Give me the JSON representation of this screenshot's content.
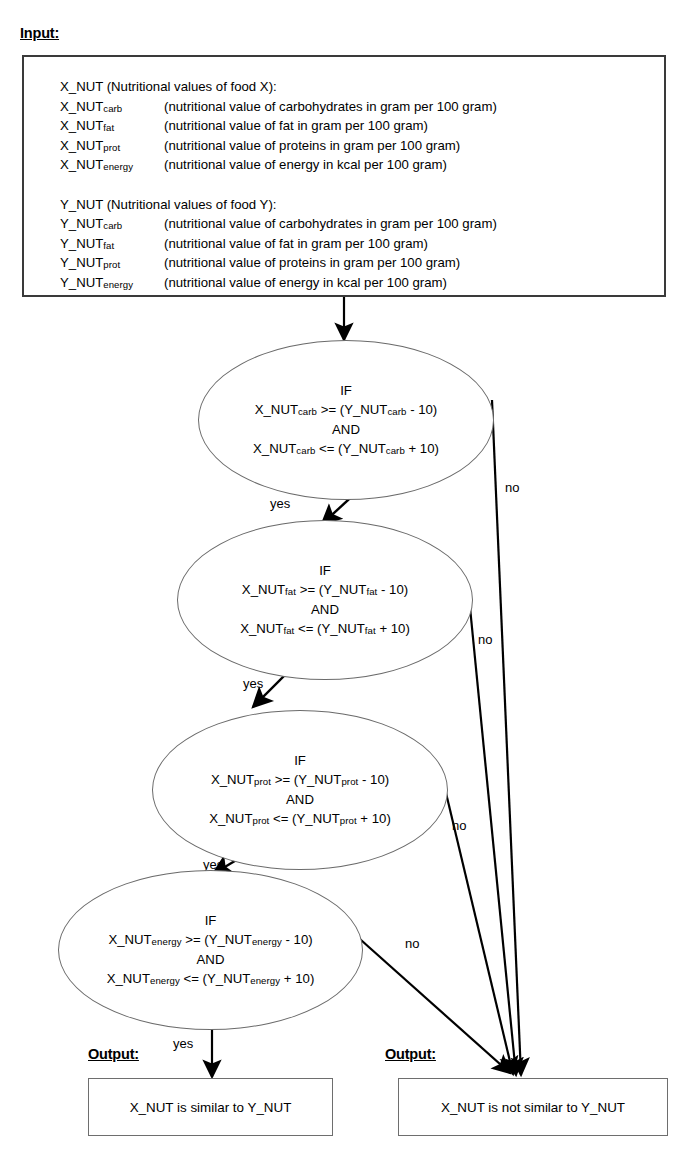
{
  "diagram": {
    "type": "flowchart",
    "title_labels": {
      "input": "Input:",
      "output_left": "Output:",
      "output_right": "Output:"
    }
  },
  "input": {
    "groups": [
      {
        "heading": "X_NUT (Nutritional values  of food X):",
        "rows": [
          {
            "name": "X_NUT",
            "sub": "carb",
            "desc": "(nutritional value of carbohydrates in gram per 100 gram)"
          },
          {
            "name": "X_NUT",
            "sub": "fat",
            "desc": "(nutritional value of fat in gram per 100 gram)"
          },
          {
            "name": "X_NUT",
            "sub": "prot",
            "desc": "(nutritional value of proteins in gram per 100 gram)"
          },
          {
            "name": "X_NUT",
            "sub": "energy",
            "desc": "(nutritional value of energy in kcal per 100 gram)"
          }
        ]
      },
      {
        "heading": "Y_NUT (Nutritional values  of food Y):",
        "rows": [
          {
            "name": "Y_NUT",
            "sub": "carb",
            "desc": "(nutritional value of carbohydrates in gram per 100 gram)"
          },
          {
            "name": "Y_NUT",
            "sub": "fat",
            "desc": "(nutritional value of fat in gram per 100 gram)"
          },
          {
            "name": "Y_NUT",
            "sub": "prot",
            "desc": "(nutritional value of proteins in gram per 100 gram)"
          },
          {
            "name": "Y_NUT",
            "sub": "energy",
            "desc": "(nutritional value of energy in kcal per 100 gram)"
          }
        ]
      }
    ]
  },
  "decisions": [
    {
      "id": "carb",
      "if": "IF",
      "line1_pre": "X_NUT",
      "line1_sub": "carb",
      "line1_mid": " >= (Y_NUT",
      "line1_sub2": "carb",
      "line1_post": " - 10)",
      "and": "AND",
      "line2_pre": "X_NUT",
      "line2_sub": "carb",
      "line2_mid": " <= (Y_NUT",
      "line2_sub2": "carb",
      "line2_post": " + 10)",
      "yes_label": "yes",
      "no_label": "no"
    },
    {
      "id": "fat",
      "if": "IF",
      "line1_pre": "X_NUT",
      "line1_sub": "fat",
      "line1_mid": " >= (Y_NUT",
      "line1_sub2": "fat",
      "line1_post": " - 10)",
      "and": "AND",
      "line2_pre": "X_NUT",
      "line2_sub": "fat",
      "line2_mid": " <= (Y_NUT",
      "line2_sub2": "fat",
      "line2_post": " + 10)",
      "yes_label": "yes",
      "no_label": "no"
    },
    {
      "id": "prot",
      "if": "IF",
      "line1_pre": "X_NUT",
      "line1_sub": "prot",
      "line1_mid": " >= (Y_NUT",
      "line1_sub2": "prot",
      "line1_post": " - 10)",
      "and": "AND",
      "line2_pre": "X_NUT",
      "line2_sub": "prot",
      "line2_mid": " <= (Y_NUT",
      "line2_sub2": "prot",
      "line2_post": " + 10)",
      "yes_label": "yes",
      "no_label": "no"
    },
    {
      "id": "energy",
      "if": "IF",
      "line1_pre": "X_NUT",
      "line1_sub": "energy",
      "line1_mid": " >= (Y_NUT",
      "line1_sub2": "energy",
      "line1_post": " - 10)",
      "and": "AND",
      "line2_pre": "X_NUT",
      "line2_sub": "energy",
      "line2_mid": " <= (Y_NUT",
      "line2_sub2": "energy",
      "line2_post": " + 10)",
      "yes_label": "yes",
      "no_label": "no"
    }
  ],
  "outputs": {
    "similar": "X_NUT is similar to Y_NUT",
    "not_similar": "X_NUT is not similar to Y_NUT"
  },
  "colors": {
    "stroke": "#000000",
    "box_border": "#3a3a3a",
    "ellipse_border": "#6b6b6b",
    "outbox_border": "#6e6e6e",
    "background": "#ffffff",
    "text": "#000000"
  }
}
